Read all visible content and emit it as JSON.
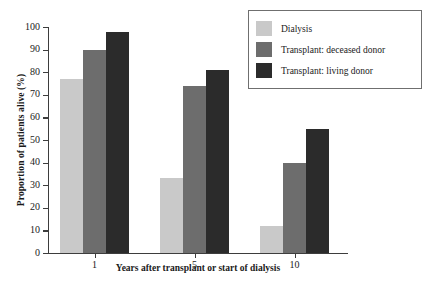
{
  "chart_data": {
    "type": "bar",
    "title": "",
    "subtitle": "",
    "xlabel": "Years after transplant or start of dialysis",
    "ylabel": "Proportion of patients alive (%)",
    "categories": [
      "1",
      "5",
      "10"
    ],
    "series": [
      {
        "name": "Dialysis",
        "color": "#c9c9c9",
        "values": [
          77,
          33,
          12
        ]
      },
      {
        "name": "Transplant: deceased donor",
        "color": "#6d6d6d",
        "values": [
          90,
          74,
          40
        ]
      },
      {
        "name": "Transplant: living donor",
        "color": "#2b2b2b",
        "values": [
          98,
          81,
          55
        ]
      }
    ],
    "ylim": [
      0,
      100
    ],
    "ytick_values": [
      0,
      10,
      20,
      30,
      40,
      50,
      60,
      70,
      80,
      90,
      100
    ],
    "ytick_labels": [
      "0",
      "10",
      "20",
      "30",
      "40",
      "50",
      "60",
      "70",
      "80",
      "90",
      "100"
    ],
    "xtick_labels": [
      "1",
      "5",
      "10"
    ],
    "grid": false,
    "legend_position": "upper-right",
    "legend_entries": [
      "Dialysis",
      "Transplant: deceased donor",
      "Transplant: living donor"
    ],
    "colors": {
      "dialysis": "#c9c9c9",
      "deceased_donor": "#6d6d6d",
      "living_donor": "#2b2b2b",
      "axis": "#3d3d3d",
      "legend_border": "#6f6f6f",
      "background": "#ffffff"
    }
  },
  "axis": {
    "y_title": "Proportion of patients alive (%)",
    "x_title": "Years after transplant or start of dialysis"
  }
}
